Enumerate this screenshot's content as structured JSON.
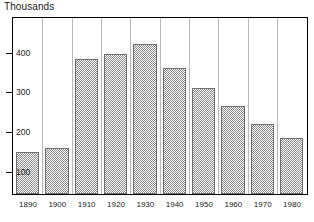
{
  "chart_data": {
    "type": "bar",
    "title": "Thousands",
    "xlabel": "",
    "ylabel": "",
    "categories": [
      "1890",
      "1900",
      "1910",
      "1920",
      "1930",
      "1940",
      "1950",
      "1960",
      "1970",
      "1980"
    ],
    "values": [
      150,
      160,
      385,
      397,
      422,
      362,
      311,
      266,
      220,
      185
    ],
    "yticks": [
      100,
      200,
      300,
      400
    ],
    "ytick_labels": [
      "100",
      "200",
      "300",
      "400"
    ],
    "ylim": [
      0,
      450
    ],
    "grid": "vertical-separators-only",
    "legend": "none",
    "bar_fill": "#8c8c8c",
    "bar_pattern": "checkerboard-hatch",
    "frame_color": "#000000"
  }
}
